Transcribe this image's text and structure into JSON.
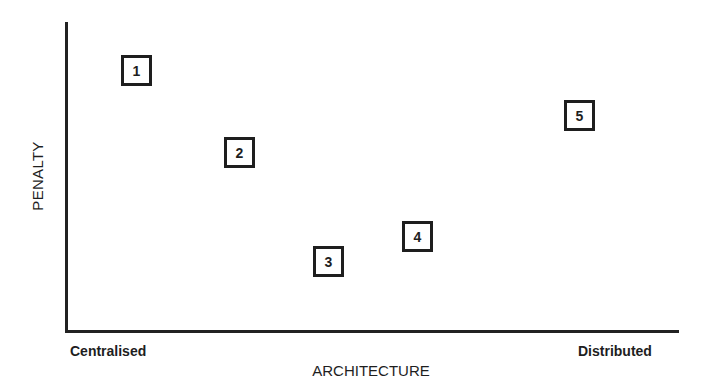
{
  "chart_data": {
    "type": "scatter",
    "title": "",
    "xlabel": "ARCHITECTURE",
    "ylabel": "PENALTY",
    "x_tick_labels": {
      "left": "Centralised",
      "right": "Distributed"
    },
    "grid": false,
    "legend": null,
    "note": "Qualitative diagram; positions are relative (0 = Centralised/low penalty, 1 = Distributed/high penalty), estimated from pixel positions.",
    "points": [
      {
        "label": "1",
        "x": 0.13,
        "y": 0.88
      },
      {
        "label": "2",
        "x": 0.3,
        "y": 0.58
      },
      {
        "label": "3",
        "x": 0.44,
        "y": 0.23
      },
      {
        "label": "4",
        "x": 0.58,
        "y": 0.32
      },
      {
        "label": "5",
        "x": 0.82,
        "y": 0.77
      }
    ]
  },
  "axes": {
    "x_title": "ARCHITECTURE",
    "y_title": "PENALTY",
    "x_left": "Centralised",
    "x_right": "Distributed"
  },
  "markers": [
    {
      "label": "1",
      "left": 121,
      "top": 55
    },
    {
      "label": "2",
      "left": 224,
      "top": 137
    },
    {
      "label": "3",
      "left": 313,
      "top": 246
    },
    {
      "label": "4",
      "left": 402,
      "top": 221
    },
    {
      "label": "5",
      "left": 564,
      "top": 100
    }
  ]
}
